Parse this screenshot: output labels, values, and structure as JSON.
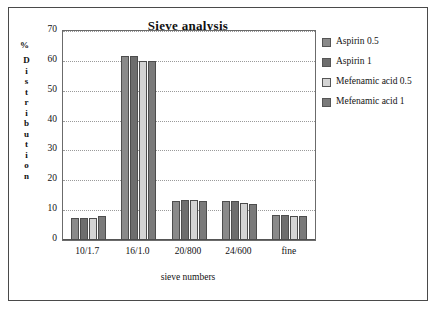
{
  "chart_data": {
    "type": "bar",
    "title": "Sieve analysis",
    "xlabel": "sieve numbers",
    "ylabel": "Distribution",
    "yunit": "%",
    "categories": [
      "10/1.7",
      "16/1.0",
      "20/800",
      "24/600",
      "fine"
    ],
    "yticks": [
      0,
      10,
      20,
      30,
      40,
      50,
      60,
      70
    ],
    "ylim": [
      0,
      70
    ],
    "grid": true,
    "legend_position": "right",
    "series": [
      {
        "name": "Aspirin 0.5",
        "color": "#8a8a8a",
        "values": [
          7.5,
          61.5,
          13.0,
          13.0,
          8.5
        ]
      },
      {
        "name": "Aspirin 1",
        "color": "#6e6e6e",
        "values": [
          7.5,
          61.5,
          13.5,
          13.0,
          8.5
        ]
      },
      {
        "name": "Mefenamic acid 0.5",
        "color": "#d4d4d4",
        "values": [
          7.5,
          60.0,
          13.5,
          12.5,
          8.0
        ]
      },
      {
        "name": "Mefenamic acid 1",
        "color": "#7a7a7a",
        "values": [
          8.0,
          60.0,
          13.0,
          12.0,
          8.0
        ]
      }
    ]
  },
  "legend": {
    "items": [
      {
        "label": "Aspirin 0.5"
      },
      {
        "label": "Aspirin 1"
      },
      {
        "label": "Mefenamic acid 0.5"
      },
      {
        "label": "Mefenamic acid 1"
      }
    ]
  },
  "axis": {
    "y_label_letters": "D i s t r i b u t i o n",
    "percent_symbol": "%"
  }
}
